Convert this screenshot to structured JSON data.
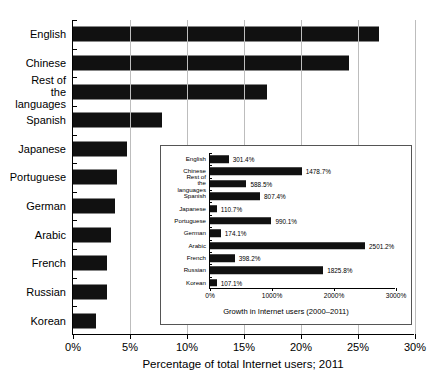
{
  "chart_data": [
    {
      "id": "main",
      "type": "bar",
      "orientation": "horizontal",
      "title": "",
      "xlabel": "Percentage of total Internet users; 2011",
      "ylabel": "",
      "xlim": [
        0,
        30
      ],
      "xticks": [
        "0%",
        "5%",
        "10%",
        "15%",
        "20%",
        "25%",
        "30%"
      ],
      "xtick_values": [
        0,
        5,
        10,
        15,
        20,
        25,
        30
      ],
      "grid": true,
      "legend": "none",
      "bar_color": "#111111",
      "categories": [
        "English",
        "Chinese",
        "Rest of the\nlanguages",
        "Spanish",
        "Japanese",
        "Portuguese",
        "German",
        "Arabic",
        "French",
        "Russian",
        "Korean"
      ],
      "values": [
        26.8,
        24.2,
        17.0,
        7.8,
        4.7,
        3.9,
        3.7,
        3.3,
        3.0,
        3.0,
        2.0
      ]
    },
    {
      "id": "inset",
      "type": "bar",
      "orientation": "horizontal",
      "title": "",
      "xlabel": "Growth in Internet users (2000–2011)",
      "ylabel": "",
      "xlim": [
        0,
        3000
      ],
      "xticks": [
        "0%",
        "1000%",
        "2000%",
        "3000%"
      ],
      "xtick_values": [
        0,
        1000,
        2000,
        3000
      ],
      "grid": false,
      "legend": "none",
      "bar_color": "#111111",
      "categories": [
        "English",
        "Chinese",
        "Rest of the\nlanguages",
        "Spanish",
        "Japanese",
        "Portuguese",
        "German",
        "Arabic",
        "French",
        "Russian",
        "Korean"
      ],
      "values": [
        301.4,
        1478.7,
        588.5,
        807.4,
        110.7,
        990.1,
        174.1,
        2501.2,
        398.2,
        1825.8,
        107.1
      ],
      "data_labels": [
        "301.4%",
        "1478.7%",
        "588.5%",
        "807.4%",
        "110.7%",
        "990.1%",
        "174.1%",
        "2501.2%",
        "398.2%",
        "1825.8%",
        "107.1%"
      ]
    }
  ]
}
